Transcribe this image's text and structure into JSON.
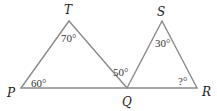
{
  "diagram": {
    "type": "geometry",
    "line_color": "#8a8a8a",
    "text_color": "#222222",
    "vertices": [
      {
        "id": "P",
        "label": "P",
        "x": 21,
        "y": 88,
        "label_x": 7,
        "label_y": 97
      },
      {
        "id": "T",
        "label": "T",
        "x": 69,
        "y": 21,
        "label_x": 64,
        "label_y": 14
      },
      {
        "id": "Q",
        "label": "Q",
        "x": 127,
        "y": 88,
        "label_x": 122,
        "label_y": 106
      },
      {
        "id": "S",
        "label": "S",
        "x": 162,
        "y": 21,
        "label_x": 157,
        "label_y": 16
      },
      {
        "id": "R",
        "label": "R",
        "x": 197,
        "y": 88,
        "label_x": 202,
        "label_y": 96
      }
    ],
    "edges": [
      [
        "P",
        "T"
      ],
      [
        "T",
        "Q"
      ],
      [
        "P",
        "R"
      ],
      [
        "Q",
        "S"
      ],
      [
        "S",
        "R"
      ]
    ],
    "triangles": [
      [
        "P",
        "T",
        "Q"
      ],
      [
        "Q",
        "S",
        "R"
      ]
    ],
    "angles": [
      {
        "vertex": "T",
        "label": "70°",
        "x": 61,
        "y": 42
      },
      {
        "vertex": "P",
        "label": "60°",
        "x": 31,
        "y": 87
      },
      {
        "vertex": "Q",
        "label": "50°",
        "x": 113,
        "y": 76
      },
      {
        "vertex": "S",
        "label": "30°",
        "x": 155,
        "y": 47
      },
      {
        "vertex": "R",
        "label": "?°",
        "x": 178,
        "y": 85
      }
    ]
  }
}
